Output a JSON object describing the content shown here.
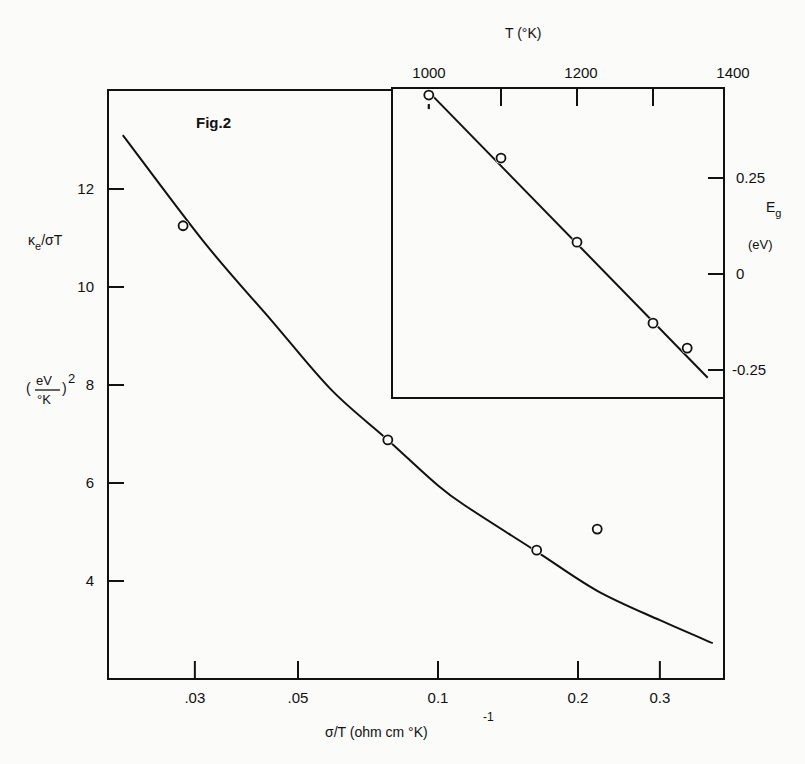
{
  "figure": {
    "title": "Fig.2"
  },
  "chart_data": [
    {
      "id": "main",
      "type": "scatter",
      "title": "Fig.2",
      "xlabel": "σ/T (ohm cm °K)",
      "xlabel_superscript": "-1",
      "ylabel": "κe/σT",
      "ylabel_units": "(eV/°K)^2",
      "ylabel_line1": "κ",
      "ylabel_sub": "e",
      "ylabel_line1_rest": "/σT",
      "ylabel_units_num": "eV",
      "ylabel_units_den": "°K",
      "ylabel_units_exp": "2",
      "xscale": "log",
      "xlim": [
        0.0195,
        0.44
      ],
      "ylim": [
        1.95,
        14.0
      ],
      "grid": false,
      "x_ticks": [
        0.03,
        0.05,
        0.1,
        0.2,
        0.3
      ],
      "x_tick_labels": [
        ".03",
        ".05",
        "0.1",
        "0.2",
        "0.3"
      ],
      "y_ticks": [
        4,
        6,
        8,
        10,
        12
      ],
      "y_tick_labels": [
        "4",
        "6",
        "8",
        "10",
        "12"
      ],
      "series": [
        {
          "name": "measured",
          "marker": "open-circle",
          "x": [
            0.0283,
            0.078,
            0.163,
            0.22
          ],
          "y": [
            11.25,
            6.88,
            4.63,
            5.06
          ]
        },
        {
          "name": "theoretical curve",
          "style": "solid-line",
          "x": [
            0.021,
            0.0315,
            0.044,
            0.059,
            0.078,
            0.1,
            0.116,
            0.163,
            0.22,
            0.3,
            0.39
          ],
          "y": [
            13.1,
            10.9,
            9.3,
            7.9,
            6.88,
            5.95,
            5.5,
            4.6,
            3.8,
            3.2,
            2.73
          ]
        }
      ]
    },
    {
      "id": "inset",
      "type": "scatter",
      "xlabel": "T (°K)",
      "ylabel": "Eg",
      "ylabel_main": "E",
      "ylabel_sub": "g",
      "ylabel_units": "(eV)",
      "xlim": [
        950,
        1400
      ],
      "ylim": [
        -0.32,
        0.48
      ],
      "grid": false,
      "x_ticks": [
        1000,
        1100,
        1200,
        1300,
        1400
      ],
      "x_tick_labels": [
        "1000",
        "1200",
        "1400"
      ],
      "x_labeled_values": [
        1000,
        1200,
        1400
      ],
      "y_ticks": [
        0.25,
        0,
        -0.25
      ],
      "y_tick_labels": [
        "0.25",
        "0",
        "-0.25"
      ],
      "series": [
        {
          "name": "measured",
          "marker": "open-circle",
          "x": [
            1005,
            1100,
            1200,
            1300,
            1345
          ],
          "y": [
            0.466,
            0.302,
            0.083,
            -0.128,
            -0.193
          ]
        },
        {
          "name": "linear fit",
          "style": "solid-line",
          "x": [
            1010,
            1372
          ],
          "y": [
            0.464,
            -0.27
          ]
        }
      ]
    }
  ]
}
